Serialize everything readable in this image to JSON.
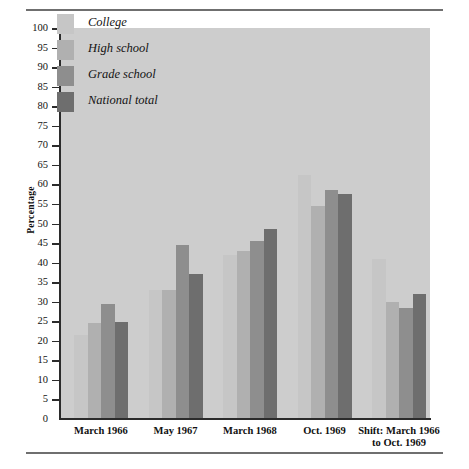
{
  "chart_data": {
    "type": "bar",
    "title": "",
    "subtitle": "",
    "xlabel": "",
    "ylabel": "Percentage",
    "ylim": [
      0,
      100
    ],
    "ytick_step": 5,
    "yticks": [
      100,
      95,
      90,
      85,
      80,
      75,
      70,
      65,
      60,
      55,
      50,
      45,
      40,
      35,
      30,
      25,
      20,
      15,
      10,
      5,
      0
    ],
    "grid": false,
    "legend_position": "inside-top-left",
    "categories": [
      "March 1966",
      "May 1967",
      "March 1968",
      "Oct. 1969",
      "Shift: March 1966 to Oct. 1969"
    ],
    "series": [
      {
        "name": "College",
        "color": "#c6c6c6",
        "values": [
          21.5,
          33.0,
          42.0,
          62.5,
          41.0
        ]
      },
      {
        "name": "High school",
        "color": "#b0b0b0",
        "values": [
          24.5,
          33.0,
          43.0,
          54.5,
          30.0
        ]
      },
      {
        "name": "Grade school",
        "color": "#8e8e8e",
        "values": [
          29.3,
          44.5,
          45.5,
          58.5,
          28.5
        ]
      },
      {
        "name": "National total",
        "color": "#6e6e6e",
        "values": [
          24.8,
          37.0,
          48.5,
          57.5,
          32.0
        ]
      }
    ]
  },
  "axis": {
    "y_title": "Percentage"
  },
  "legend": {
    "items": [
      {
        "label": "College",
        "color": "#c6c6c6"
      },
      {
        "label": "High school",
        "color": "#b0b0b0"
      },
      {
        "label": "Grade school",
        "color": "#8e8e8e"
      },
      {
        "label": "National total",
        "color": "#6e6e6e"
      }
    ]
  },
  "xlabels": [
    {
      "lines": [
        "March 1966"
      ]
    },
    {
      "lines": [
        "May 1967"
      ]
    },
    {
      "lines": [
        "March 1968"
      ]
    },
    {
      "lines": [
        "Oct. 1969"
      ]
    },
    {
      "lines": [
        "Shift: March 1966",
        "to Oct. 1969"
      ]
    }
  ],
  "style": {
    "plot_background": "#cdcdcd",
    "axis_color": "#2b2b2b",
    "rule_color": "#6f6f6f",
    "page_background": "#ffffff"
  }
}
